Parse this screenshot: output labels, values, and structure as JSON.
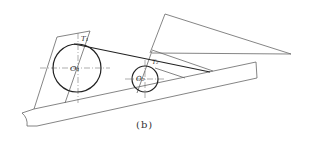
{
  "figure": {
    "caption": "(b)",
    "labels": {
      "center_large": "O₁",
      "center_small": "O₂",
      "tangent_large": "T₁",
      "tangent_small": "T₂"
    },
    "colors": {
      "line": "#555555",
      "circle": "#222222",
      "background": "#ffffff"
    }
  }
}
